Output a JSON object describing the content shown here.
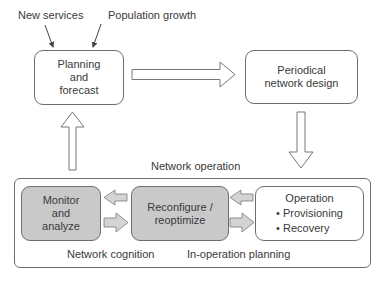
{
  "inputs": {
    "new_services": "New services",
    "population_growth": "Population growth"
  },
  "boxes": {
    "planning": {
      "lines": [
        "Planning",
        "and",
        "forecast"
      ]
    },
    "periodical": {
      "lines": [
        "Periodical",
        "network design"
      ]
    },
    "monitor": {
      "lines": [
        "Monitor",
        "and",
        "analyze"
      ]
    },
    "reconfigure": {
      "lines": [
        "Reconfigure /",
        "reoptimize"
      ]
    },
    "operation": {
      "title": "Operation",
      "items": [
        "Provisioning",
        "Recovery"
      ]
    }
  },
  "container": {
    "title": "Network operation",
    "labels": {
      "cognition": "Network cognition",
      "in_operation": "In-operation planning"
    }
  },
  "colors": {
    "stroke": "#6e6e6e",
    "gray_box_fill": "#c9c9c9",
    "small_arrow_fill": "#d4d4d4",
    "background": "#ffffff"
  }
}
